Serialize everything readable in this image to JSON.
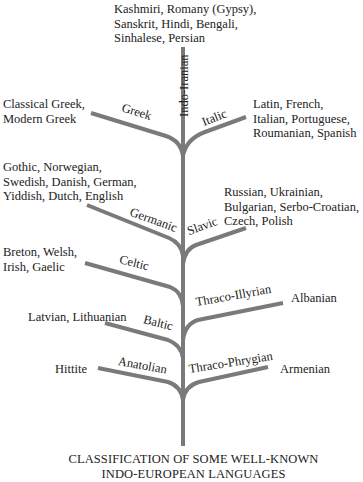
{
  "diagram": {
    "type": "tree",
    "title_lines": [
      "CLASSIFICATION OF SOME WELL-KNOWN",
      "INDO-EUROPEAN LANGUAGES"
    ],
    "branch_color": "#7a7a7a",
    "trunk": {
      "label": "Indo-Iranian"
    },
    "branches": [
      {
        "id": "indo-iranian",
        "label": "Indo-Iranian",
        "side": "top",
        "languages_lines": [
          "Kashmiri, Romany (Gypsy),",
          "Sanskrit, Hindi, Bengali,",
          "Sinhalese, Persian"
        ]
      },
      {
        "id": "greek",
        "label": "Greek",
        "side": "left",
        "languages_lines": [
          "Classical Greek,",
          "Modern Greek"
        ]
      },
      {
        "id": "italic",
        "label": "Italic",
        "side": "right",
        "languages_lines": [
          "Latin, French,",
          "Italian, Portuguese,",
          "Roumanian, Spanish"
        ]
      },
      {
        "id": "germanic",
        "label": "Germanic",
        "side": "left",
        "languages_lines": [
          "Gothic, Norwegian,",
          "Swedish, Danish, German,",
          "Yiddish, Dutch, English"
        ]
      },
      {
        "id": "slavic",
        "label": "Slavic",
        "side": "right",
        "languages_lines": [
          "Russian, Ukrainian,",
          "Bulgarian, Serbo-Croatian,",
          "Czech, Polish"
        ]
      },
      {
        "id": "celtic",
        "label": "Celtic",
        "side": "left",
        "languages_lines": [
          "Breton, Welsh,",
          "Irish, Gaelic"
        ]
      },
      {
        "id": "thraco-illyrian",
        "label": "Thraco-Illyrian",
        "side": "right",
        "languages_lines": [
          "Albanian"
        ]
      },
      {
        "id": "baltic",
        "label": "Baltic",
        "side": "left",
        "languages_lines": [
          "Latvian, Lithuanian"
        ]
      },
      {
        "id": "anatolian",
        "label": "Anatolian",
        "side": "left",
        "languages_lines": [
          "Hittite"
        ]
      },
      {
        "id": "thraco-phrygian",
        "label": "Thraco-Phrygian",
        "side": "right",
        "languages_lines": [
          "Armenian"
        ]
      }
    ]
  }
}
